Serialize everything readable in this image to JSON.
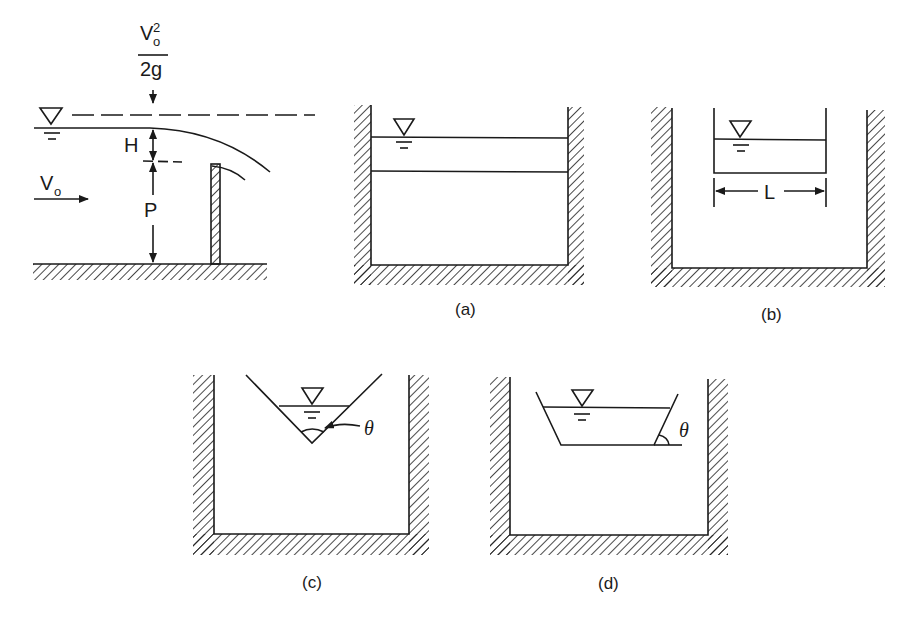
{
  "figure": {
    "weir_profile": {
      "velocity_head_numerator": "V",
      "velocity_head_sub": "o",
      "velocity_head_sup": "2",
      "velocity_head_denominator": "2g",
      "head_label": "H",
      "weir_height_label": "P",
      "approach_velocity_label": "V",
      "approach_velocity_sub": "o",
      "water_surface_symbol": "triangle-water-surface"
    },
    "panels": [
      {
        "id": "a",
        "caption": "(a)",
        "type": "rectangular-suppressed"
      },
      {
        "id": "b",
        "caption": "(b)",
        "type": "rectangular-contracted",
        "width_label": "L"
      },
      {
        "id": "c",
        "caption": "(c)",
        "type": "v-notch-triangular",
        "angle_label": "θ"
      },
      {
        "id": "d",
        "caption": "(d)",
        "type": "trapezoidal",
        "angle_label": "θ"
      }
    ],
    "colors": {
      "line": "#1a1a1a",
      "background": "#ffffff"
    }
  }
}
